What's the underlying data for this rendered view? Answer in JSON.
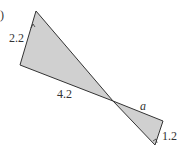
{
  "figure": {
    "part_marker": ")",
    "fill_color": "#d0d0d0",
    "stroke_color": "#333333",
    "triangles": [
      {
        "name": "large-triangle",
        "vertices": [
          [
            36,
            11
          ],
          [
            20,
            65
          ],
          [
            113,
            101
          ]
        ],
        "side_labels": [
          {
            "text": "2.2",
            "side": "left"
          },
          {
            "text": "4.2",
            "side": "bottom"
          }
        ]
      },
      {
        "name": "small-triangle",
        "vertices": [
          [
            113,
            101
          ],
          [
            163,
            121
          ],
          [
            155,
            145
          ]
        ],
        "side_labels": [
          {
            "text": "a",
            "side": "top"
          },
          {
            "text": "1.2",
            "side": "right"
          }
        ]
      }
    ],
    "labels": {
      "left_side": "2.2",
      "bottom_side": "4.2",
      "unknown_side": "a",
      "right_side": "1.2"
    }
  }
}
